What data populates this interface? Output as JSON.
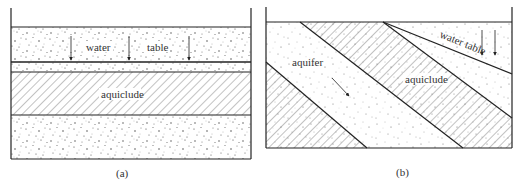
{
  "figure": {
    "panels": [
      {
        "id": "a",
        "caption": "(a)",
        "labels": {
          "water": "water",
          "table": "table",
          "aquiclude": "aquiclude"
        },
        "layers_top_to_bottom": [
          "unsaturated sand",
          "water table",
          "saturated sand",
          "aquiclude",
          "sand"
        ]
      },
      {
        "id": "b",
        "caption": "(b)",
        "labels": {
          "water_table": "water table",
          "aquifer": "aquifer",
          "aquiclude": "aquiclude"
        },
        "layers": [
          "aquiclude (lower-left)",
          "aquifer",
          "aquiclude (middle band)",
          "sand above water table"
        ]
      }
    ],
    "colors": {
      "line": "#222222",
      "hatch": "#555555",
      "speckle": "#444444",
      "background": "#ffffff"
    }
  }
}
